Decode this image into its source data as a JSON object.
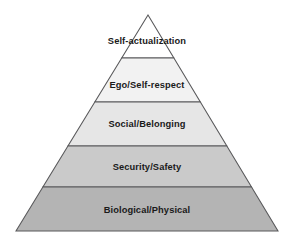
{
  "diagram": {
    "type": "pyramid",
    "background_color": "#ffffff",
    "outline_color": "#58585a",
    "text_color": "#1a1a1a",
    "apex": {
      "x": 148,
      "y": 15
    },
    "base": {
      "left_x": 16,
      "right_x": 278,
      "y": 231
    },
    "divider_y": [
      58,
      102,
      146,
      187
    ],
    "levels": [
      {
        "index": 1,
        "position": "top",
        "label": "Self-actualization",
        "fill": "#ffffff",
        "label_y": 44
      },
      {
        "index": 2,
        "position": "upper-middle",
        "label": "Ego/Self-respect",
        "fill": "#f2f2f2",
        "label_y": 88
      },
      {
        "index": 3,
        "position": "middle",
        "label": "Social/Belonging",
        "fill": "#e6e6e6",
        "label_y": 127
      },
      {
        "index": 4,
        "position": "lower-middle",
        "label": "Security/Safety",
        "fill": "#cacaca",
        "label_y": 170
      },
      {
        "index": 5,
        "position": "bottom",
        "label": "Biological/Physical",
        "fill": "#b4b4b4",
        "label_y": 213
      }
    ]
  }
}
